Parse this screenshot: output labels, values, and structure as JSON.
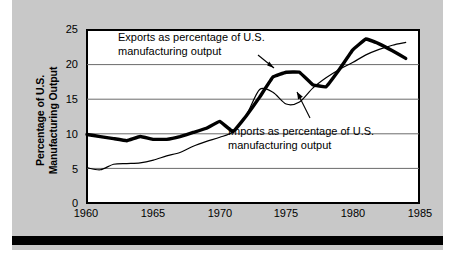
{
  "chart_data": {
    "type": "line",
    "title": "",
    "xlabel": "",
    "ylabel": "Percentage of U.S. Manufacturing Output",
    "ylabel_line1": "Percentage of U.S.",
    "ylabel_line2": "Manufacturing Output",
    "xlim": [
      1960,
      1985
    ],
    "ylim": [
      0,
      25
    ],
    "xticks": [
      "1960",
      "1965",
      "1970",
      "1975",
      "1980",
      "1985"
    ],
    "yticks": [
      "0",
      "5",
      "10",
      "15",
      "20",
      "25"
    ],
    "gridlines_y": [
      5,
      10,
      15,
      20
    ],
    "grid": true,
    "legend_position": "annotations",
    "annotations": [
      {
        "id": "exports",
        "line1": "Exports as percentage of U.S.",
        "line2": "manufacturing output"
      },
      {
        "id": "imports",
        "line1": "Imports as percentage of U.S.",
        "line2": "manufacturing output"
      }
    ],
    "x": [
      1960,
      1961,
      1962,
      1963,
      1964,
      1965,
      1966,
      1967,
      1968,
      1969,
      1970,
      1971,
      1972,
      1973,
      1974,
      1975,
      1976,
      1977,
      1978,
      1979,
      1980,
      1981,
      1982,
      1983,
      1984
    ],
    "series": [
      {
        "name": "Exports as percentage of U.S. manufacturing output",
        "style": "thick",
        "values": [
          9.9,
          9.6,
          9.3,
          9.0,
          9.6,
          9.2,
          9.2,
          9.6,
          10.2,
          10.8,
          11.8,
          10.3,
          12.6,
          15.3,
          18.2,
          18.9,
          18.9,
          17.1,
          16.8,
          19.3,
          22.1,
          23.7,
          23.0,
          22.0,
          20.9
        ]
      },
      {
        "name": "Imports as percentage of U.S. manufacturing output",
        "style": "thin",
        "values": [
          5.1,
          4.8,
          5.6,
          5.7,
          5.8,
          6.2,
          6.8,
          7.3,
          8.2,
          8.9,
          9.5,
          10.3,
          12.7,
          16.4,
          16.0,
          14.3,
          14.6,
          16.6,
          18.1,
          19.3,
          20.3,
          21.4,
          22.2,
          22.8,
          23.2
        ]
      }
    ]
  }
}
